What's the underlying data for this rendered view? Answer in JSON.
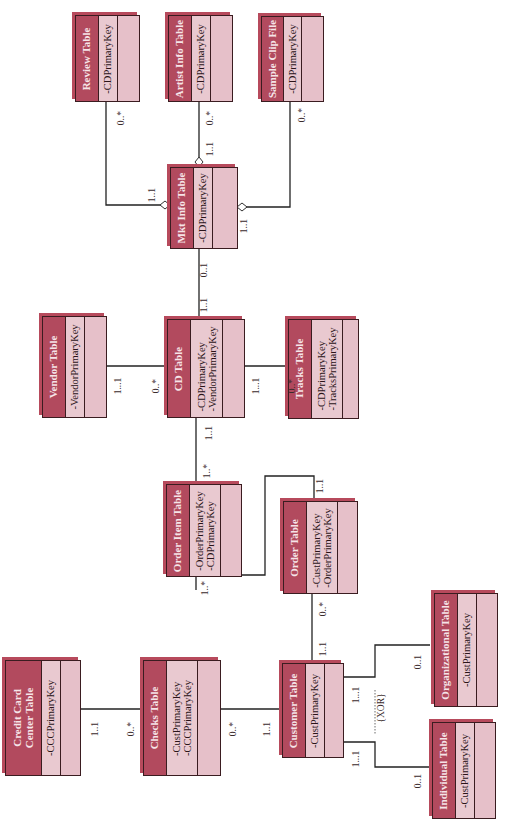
{
  "diagram": {
    "type": "UML class diagram (rotated 90° counter-clockwise)",
    "tables": {
      "credit_card_center": {
        "title": "Credit Card Center Table",
        "title_line1": "Credit Card",
        "title_line2": "Center Table",
        "attributes": [
          "-CCCPrimaryKey"
        ]
      },
      "checks": {
        "title": "Checks Table",
        "attributes": [
          "-CustPrimaryKey",
          "-CCCPrimaryKey"
        ]
      },
      "customer": {
        "title": "Customer Table",
        "attributes": [
          "-CustPrimaryKey"
        ]
      },
      "individual": {
        "title": "Individual Table",
        "attributes": [
          "-CustPrimaryKey"
        ]
      },
      "organizational": {
        "title": "Organizational Table",
        "attributes": [
          "-CustPrimaryKey"
        ]
      },
      "order": {
        "title": "Order Table",
        "attributes": [
          "-CustPrimaryKey",
          "-OrderPrimaryKey"
        ]
      },
      "order_item": {
        "title": "Order Item Table",
        "attributes": [
          "-OrderPrimaryKey",
          "-CDPrimaryKey"
        ]
      },
      "cd": {
        "title": "CD Table",
        "attributes": [
          "-CDPrimaryKey",
          "-VendorPrimaryKey"
        ]
      },
      "vendor": {
        "title": "Vendor Table",
        "attributes": [
          "-VendorPrimaryKey"
        ]
      },
      "tracks": {
        "title": "Tracks Table",
        "attributes": [
          "-CDPrimaryKey",
          "-TracksPrimaryKey"
        ]
      },
      "mkt_info": {
        "title": "Mkt Info Table",
        "attributes": [
          "-CDPrimaryKey"
        ]
      },
      "review": {
        "title": "Review Table",
        "attributes": [
          "-CDPrimaryKey"
        ]
      },
      "artist_info": {
        "title": "Artist Info Table",
        "attributes": [
          "-CDPrimaryKey"
        ]
      },
      "sample_clip": {
        "title": "Sample Clip File",
        "attributes": [
          "-CDPrimaryKey"
        ]
      }
    },
    "relationships": [
      {
        "from": "Credit Card Center Table",
        "to": "Checks Table",
        "from_mult": "1..1",
        "to_mult": "0..*"
      },
      {
        "from": "Checks Table",
        "to": "Customer Table",
        "from_mult": "0..*",
        "to_mult": "1..1"
      },
      {
        "from": "Customer Table",
        "to": "Order Table",
        "from_mult": "1..1",
        "to_mult": "0..*"
      },
      {
        "from": "Customer Table",
        "to": "Organizational Table",
        "from_mult": "1...1",
        "to_mult": "0..1"
      },
      {
        "from": "Customer Table",
        "to": "Individual Table",
        "from_mult": "1...1",
        "to_mult": "0..1"
      },
      {
        "from": "Order Table",
        "to": "Order Item Table",
        "from_mult": "1..1",
        "to_mult": "1..*"
      },
      {
        "from": "Order Item Table",
        "to": "CD Table",
        "from_mult": "1..*",
        "to_mult": "1..1"
      },
      {
        "from": "Vendor Table",
        "to": "CD Table",
        "from_mult": "1...1",
        "to_mult": "0..*"
      },
      {
        "from": "CD Table",
        "to": "Tracks Table",
        "from_mult": "1...1",
        "to_mult": "0..*"
      },
      {
        "from": "CD Table",
        "to": "Mkt Info Table",
        "from_mult": "1..1",
        "to_mult": "0..1"
      },
      {
        "from": "Mkt Info Table",
        "to": "Review Table",
        "from_mult": "1..1",
        "to_mult": "0..*",
        "aggregation": true
      },
      {
        "from": "Mkt Info Table",
        "to": "Artist Info Table",
        "from_mult": "1..1",
        "to_mult": "0..*",
        "aggregation": true
      },
      {
        "from": "Mkt Info Table",
        "to": "Sample Clip File",
        "from_mult": "1..1",
        "to_mult": "0..*",
        "aggregation": true
      }
    ],
    "constraint_label": "{XOR}",
    "multiplicity_labels": {
      "ccc_checks_a": "1..1",
      "ccc_checks_b": "0..*",
      "checks_cust_a": "0..*",
      "checks_cust_b": "1..1",
      "cust_order_a": "1..1",
      "cust_order_b": "0..*",
      "cust_org_a": "1...1",
      "cust_org_b": "0..1",
      "cust_ind_a": "1...1",
      "cust_ind_b": "0..1",
      "order_oi_a": "1..1",
      "oi_order_b": "1..*",
      "oi_cd_a": "1..*",
      "oi_cd_b": "1..1",
      "vendor_cd_a": "1...1",
      "vendor_cd_b": "0..*",
      "cd_tracks_a": "1...1",
      "cd_tracks_b": "0..*",
      "cd_mkt_a": "1..1",
      "cd_mkt_b": "0..1",
      "mkt_review_a": "1..1",
      "mkt_review_b": "0..*",
      "mkt_artist_a": "1..1",
      "mkt_artist_b": "0..*",
      "mkt_clip_a": "1..1",
      "mkt_clip_b": "0..*"
    },
    "colors": {
      "header": "#b24a5e",
      "body": "#e9c3cb",
      "border": "#3a1c20",
      "header_text": "#f6e4e8",
      "line": "#222222"
    }
  }
}
